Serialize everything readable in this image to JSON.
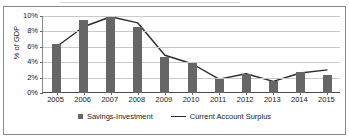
{
  "chart_data": {
    "type": "bar",
    "title": "",
    "xlabel": "",
    "ylabel": "% of GDP",
    "ylim": [
      0,
      10
    ],
    "ytick_labels": [
      "10%",
      "8%",
      "6%",
      "4%",
      "2%",
      "0%"
    ],
    "ytick_values": [
      10,
      8,
      6,
      4,
      2,
      0
    ],
    "grid": true,
    "legend_position": "bottom",
    "categories": [
      "2005",
      "2006",
      "2007",
      "2008",
      "2009",
      "2010",
      "2011",
      "2012",
      "2013",
      "2014",
      "2015"
    ],
    "series": [
      {
        "name": "Savings-Investment",
        "type": "bar",
        "color": "#666666",
        "values": [
          6.4,
          9.5,
          9.9,
          8.6,
          4.7,
          3.9,
          1.8,
          2.5,
          1.6,
          2.7,
          2.4
        ]
      },
      {
        "name": "Current Account Surplus",
        "type": "line",
        "color": "#2b2b2b",
        "values": [
          6.0,
          8.6,
          9.9,
          9.1,
          4.9,
          3.8,
          1.8,
          2.5,
          1.5,
          2.6,
          3.0
        ]
      }
    ]
  },
  "legend": {
    "items": [
      {
        "label": "Savings-Investment",
        "marker": "square-marker"
      },
      {
        "label": "Current Account Surplus",
        "marker": "line-marker"
      }
    ]
  }
}
